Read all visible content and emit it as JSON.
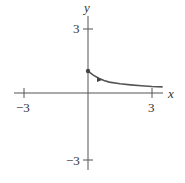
{
  "chart_data": {
    "type": "line",
    "title": "",
    "xlabel": "x",
    "ylabel": "y",
    "xlim": [
      -3.5,
      3.5
    ],
    "ylim": [
      -3.5,
      3.5
    ],
    "grid": false,
    "x_ticks": [
      {
        "value": -3,
        "label": "−3"
      },
      {
        "value": 3,
        "label": "3"
      }
    ],
    "y_ticks": [
      {
        "value": 3,
        "label": "3"
      },
      {
        "value": -3,
        "label": "−3"
      }
    ],
    "series": [
      {
        "name": "curve",
        "start_point": {
          "x": 0,
          "y": 1,
          "marker": "filled-dot"
        },
        "direction_arrow_at": {
          "x": 0.6,
          "y": 0.65
        },
        "x": [
          0,
          0.25,
          0.5,
          0.75,
          1.0,
          1.5,
          2.0,
          2.5,
          3.0,
          3.5
        ],
        "values": [
          1.0,
          0.82,
          0.68,
          0.58,
          0.5,
          0.42,
          0.37,
          0.33,
          0.3,
          0.28
        ]
      }
    ],
    "color": "#555555"
  },
  "axes": {
    "x_label": "x",
    "y_label": "y",
    "x_tick_neg": "−3",
    "x_tick_pos": "3",
    "y_tick_pos": "3",
    "y_tick_neg": "−3"
  }
}
